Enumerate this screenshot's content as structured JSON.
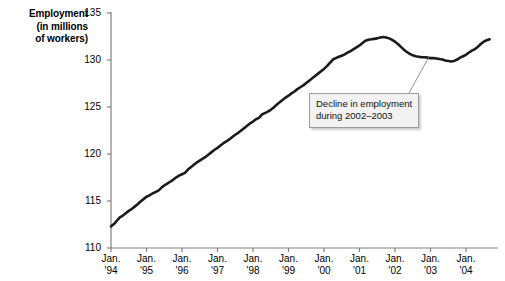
{
  "chart_data": {
    "type": "line",
    "title": "",
    "ylabel": "Employment (in millions of workers)",
    "ylabel_lines": [
      "Employment",
      "(in millions",
      "of workers)"
    ],
    "xlabel": "",
    "ylim": [
      110,
      135
    ],
    "yticks": [
      110,
      115,
      120,
      125,
      130,
      135
    ],
    "ytick_labels": [
      "110",
      "115",
      "120",
      "125",
      "130",
      "135"
    ],
    "xlim": [
      "Jan. '94",
      "Jul. '04"
    ],
    "xticks": [
      "1994",
      "1995",
      "1996",
      "1997",
      "1998",
      "1999",
      "2000",
      "2001",
      "2002",
      "2003",
      "2004"
    ],
    "xtick_labels": [
      {
        "line1": "Jan.",
        "line2": "'94"
      },
      {
        "line1": "Jan.",
        "line2": "'95"
      },
      {
        "line1": "Jan.",
        "line2": "'96"
      },
      {
        "line1": "Jan.",
        "line2": "'97"
      },
      {
        "line1": "Jan.",
        "line2": "'98"
      },
      {
        "line1": "Jan.",
        "line2": "'99"
      },
      {
        "line1": "Jan.",
        "line2": "'00"
      },
      {
        "line1": "Jan.",
        "line2": "'01"
      },
      {
        "line1": "Jan.",
        "line2": "'02"
      },
      {
        "line1": "Jan.",
        "line2": "'03"
      },
      {
        "line1": "Jan.",
        "line2": "'04"
      }
    ],
    "grid": false,
    "legend": null,
    "line_color": "#1a1a1a",
    "axis_color": "#808080",
    "series": [
      {
        "name": "Employment",
        "x_start_year": 1994.0,
        "x_step_years": 0.0833333,
        "values": [
          112.3,
          112.55,
          112.9,
          113.25,
          113.45,
          113.7,
          113.95,
          114.15,
          114.4,
          114.65,
          114.95,
          115.2,
          115.45,
          115.6,
          115.8,
          115.95,
          116.1,
          116.4,
          116.65,
          116.85,
          117.05,
          117.25,
          117.5,
          117.7,
          117.85,
          118.0,
          118.35,
          118.6,
          118.85,
          119.1,
          119.3,
          119.5,
          119.7,
          119.95,
          120.2,
          120.45,
          120.65,
          120.9,
          121.15,
          121.35,
          121.55,
          121.8,
          122.05,
          122.25,
          122.5,
          122.75,
          123.0,
          123.25,
          123.45,
          123.7,
          123.85,
          124.2,
          124.35,
          124.5,
          124.7,
          124.95,
          125.25,
          125.5,
          125.75,
          126.0,
          126.2,
          126.45,
          126.65,
          126.9,
          127.1,
          127.3,
          127.55,
          127.8,
          128.05,
          128.3,
          128.55,
          128.8,
          129.05,
          129.35,
          129.7,
          130.05,
          130.2,
          130.35,
          130.45,
          130.6,
          130.8,
          130.95,
          131.15,
          131.35,
          131.55,
          131.8,
          132.05,
          132.15,
          132.2,
          132.25,
          132.3,
          132.4,
          132.45,
          132.4,
          132.3,
          132.15,
          131.95,
          131.7,
          131.4,
          131.1,
          130.85,
          130.65,
          130.5,
          130.4,
          130.35,
          130.3,
          130.3,
          130.25,
          130.2,
          130.2,
          130.15,
          130.1,
          130.05,
          129.95,
          129.9,
          129.85,
          129.9,
          130.05,
          130.25,
          130.4,
          130.55,
          130.8,
          131.0,
          131.15,
          131.4,
          131.7,
          131.95,
          132.1,
          132.2
        ]
      }
    ],
    "annotations": [
      {
        "id": "decline-callout",
        "line1": "Decline in employment",
        "line2": "during 2002–2003",
        "points_to_year": 2002.0,
        "points_to_value": 130.4
      }
    ]
  }
}
